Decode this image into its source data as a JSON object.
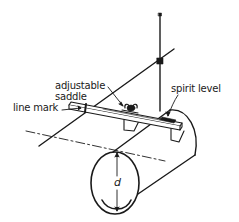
{
  "diagram": {
    "type": "technical-line-drawing",
    "colors": {
      "ink": "#1a1a1a",
      "background": "#ffffff"
    },
    "labels": {
      "adjustable_saddle_line1": "adjustable",
      "adjustable_saddle_line2": "saddle",
      "spirit_level": "spirit level",
      "line_mark": "line mark",
      "diameter": "d"
    },
    "components": [
      "vertical-rod",
      "diagonal-string-line",
      "level-bar",
      "adjustable-saddle",
      "wing-nut",
      "spirit-level",
      "pipe",
      "centerline",
      "diameter-dimension"
    ]
  }
}
